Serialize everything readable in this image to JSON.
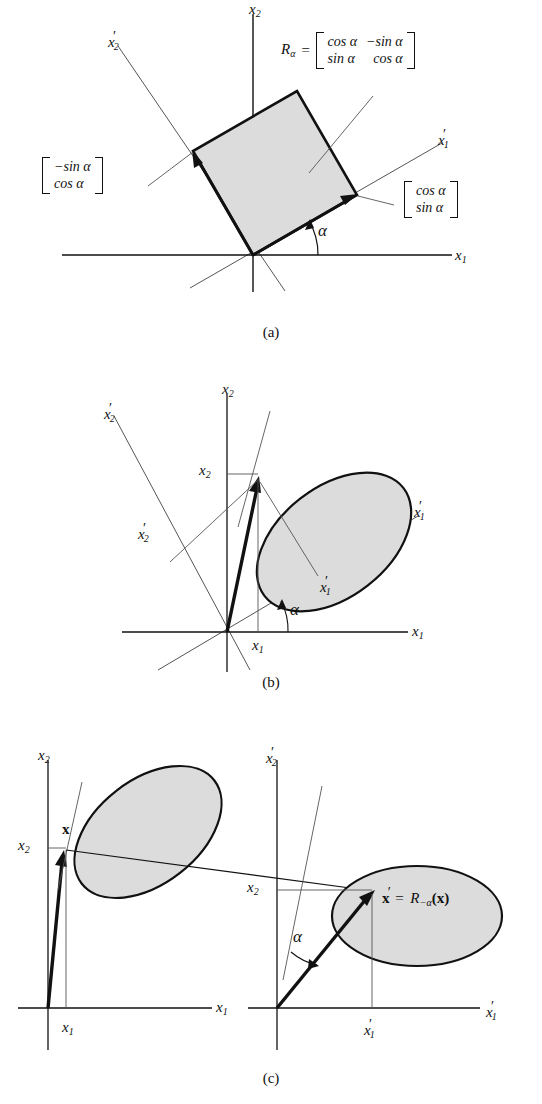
{
  "figure": {
    "background_color": "#ffffff",
    "ink_color": "#111111",
    "shape_fill": "#dcdcdc",
    "shape_stroke": "#111111",
    "thin_line_color": "#555555",
    "captions": {
      "a": "(a)",
      "b": "(b)",
      "c": "(c)"
    }
  },
  "symbols": {
    "x1": "x",
    "x2": "x",
    "sub1": "1",
    "sub2": "2",
    "prime": "′",
    "alpha": "α",
    "cos": "cos",
    "sin": "sin",
    "minus": "−",
    "equals": "="
  },
  "panel_a": {
    "caption": "(a)",
    "rotation_angle_deg": 30,
    "axes": [
      {
        "name": "x1-axis",
        "label_base": "x",
        "label_sub": "1",
        "primed": false
      },
      {
        "name": "x2-axis",
        "label_base": "x",
        "label_sub": "2",
        "primed": false
      },
      {
        "name": "x1-prime-axis",
        "label_base": "x",
        "label_sub": "1",
        "primed": true
      },
      {
        "name": "x2-prime-axis",
        "label_base": "x",
        "label_sub": "2",
        "primed": true
      }
    ],
    "angle_label": "α",
    "matrix": {
      "lead_base": "R",
      "lead_sub": "α",
      "equals": "=",
      "rows": [
        [
          "cos α",
          "−sin α"
        ],
        [
          "sin α",
          "cos α"
        ]
      ]
    },
    "vector_right": {
      "name": "first-column-vector",
      "rows": [
        "cos α",
        "sin α"
      ]
    },
    "vector_left": {
      "name": "second-column-vector",
      "rows": [
        "−sin α",
        "cos α"
      ]
    },
    "shape": {
      "name": "rotated-unit-square",
      "fill": "#dcdcdc"
    }
  },
  "panel_b": {
    "caption": "(b)",
    "rotation_angle_deg": 22,
    "angle_label": "α",
    "axis_labels": [
      {
        "name": "x1-axis-label",
        "base": "x",
        "sub": "1",
        "primed": false
      },
      {
        "name": "x2-axis-label",
        "base": "x",
        "sub": "2",
        "primed": false
      },
      {
        "name": "x1-prime-axis-label",
        "base": "x",
        "sub": "1",
        "primed": true
      },
      {
        "name": "x2-prime-axis-label",
        "base": "x",
        "sub": "2",
        "primed": true
      }
    ],
    "coordinate_labels": [
      {
        "name": "x1-coordinate",
        "base": "x",
        "sub": "1",
        "primed": false
      },
      {
        "name": "x2-coordinate",
        "base": "x",
        "sub": "2",
        "primed": false
      },
      {
        "name": "x1-prime-coordinate",
        "base": "x",
        "sub": "1",
        "primed": true
      },
      {
        "name": "x2-prime-coordinate",
        "base": "x",
        "sub": "2",
        "primed": true
      }
    ],
    "shape": {
      "name": "data-ellipse",
      "fill": "#dcdcdc",
      "tilt_deg": -38
    },
    "vector": {
      "name": "x-vector",
      "bold": true
    }
  },
  "panel_c": {
    "caption": "(c)",
    "left_plot": {
      "name": "original-frame-plot",
      "axis_labels": [
        {
          "name": "x1-axis-label",
          "base": "x",
          "sub": "1",
          "primed": false
        },
        {
          "name": "x2-axis-label",
          "base": "x",
          "sub": "2",
          "primed": false
        }
      ],
      "coordinate_labels": [
        {
          "name": "x1-coordinate",
          "base": "x",
          "sub": "1",
          "primed": false
        },
        {
          "name": "x2-coordinate",
          "base": "x",
          "sub": "2",
          "primed": false
        }
      ],
      "point_label": "x",
      "point_label_bold": true,
      "shape": {
        "name": "data-ellipse",
        "fill": "#dcdcdc",
        "tilt_deg": -38
      }
    },
    "right_plot": {
      "name": "rotated-frame-plot",
      "angle_label": "α",
      "axis_labels": [
        {
          "name": "x1-prime-axis-label",
          "base": "x",
          "sub": "1",
          "primed": true
        },
        {
          "name": "x2-prime-axis-label",
          "base": "x",
          "sub": "2",
          "primed": true
        }
      ],
      "coordinate_labels": [
        {
          "name": "x1-prime-coordinate",
          "base": "x",
          "sub": "1",
          "primed": true
        },
        {
          "name": "x2-coordinate",
          "base": "x",
          "sub": "2",
          "primed": false
        }
      ],
      "equation": {
        "name": "rotated-vector-equation",
        "lhs": "x′",
        "equals": "=",
        "operator_base": "R",
        "operator_sub": "−α",
        "argument": "(x)",
        "full_text": "x′ = R−α(x)"
      },
      "shape": {
        "name": "data-ellipse",
        "fill": "#dcdcdc",
        "tilt_deg": 0
      }
    }
  }
}
